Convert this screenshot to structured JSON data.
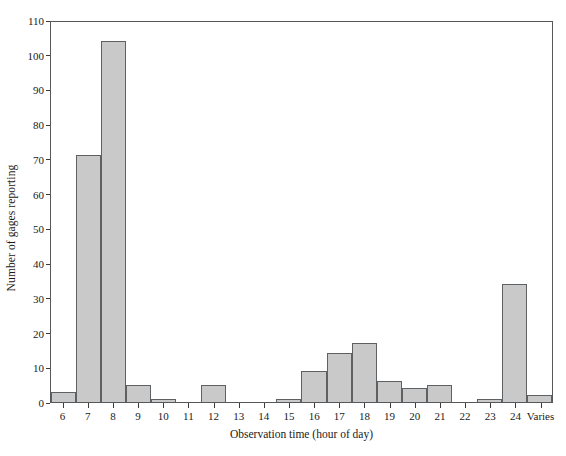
{
  "chart_data": {
    "type": "bar",
    "title": "",
    "subtitle": "",
    "xlabel": "Observation time (hour of day)",
    "ylabel": "Number of gages reporting",
    "categories": [
      "6",
      "7",
      "8",
      "9",
      "10",
      "11",
      "12",
      "13",
      "14",
      "15",
      "16",
      "17",
      "18",
      "19",
      "20",
      "21",
      "22",
      "23",
      "24",
      "Varies"
    ],
    "values": [
      3,
      71,
      104,
      5,
      1,
      0,
      5,
      0,
      0,
      1,
      9,
      14,
      17,
      6,
      4,
      5,
      0,
      1,
      34,
      2
    ],
    "series": [
      {
        "name": "Number of gages reporting",
        "values": [
          3,
          71,
          104,
          5,
          1,
          0,
          5,
          0,
          0,
          1,
          9,
          14,
          17,
          6,
          4,
          5,
          0,
          1,
          34,
          2
        ]
      }
    ],
    "ylim": [
      0,
      110
    ],
    "yticks": [
      0,
      10,
      20,
      30,
      40,
      50,
      60,
      70,
      80,
      90,
      100,
      110
    ],
    "ytick_labels": [
      "0",
      "10",
      "20",
      "30",
      "40",
      "50",
      "60",
      "70",
      "80",
      "90",
      "100",
      "110"
    ],
    "xtick_labels": [
      "6",
      "7",
      "8",
      "9",
      "10",
      "11",
      "12",
      "13",
      "14",
      "15",
      "16",
      "17",
      "18",
      "19",
      "20",
      "21",
      "22",
      "23",
      "24",
      "Varies"
    ],
    "grid": false,
    "legend": null,
    "legend_position": "none",
    "annotations": [],
    "bar_fill_color": "#c9c9c9",
    "bar_edge_color": "#5d6164",
    "axis_color": "#55595c",
    "background_color": "#ffffff"
  }
}
